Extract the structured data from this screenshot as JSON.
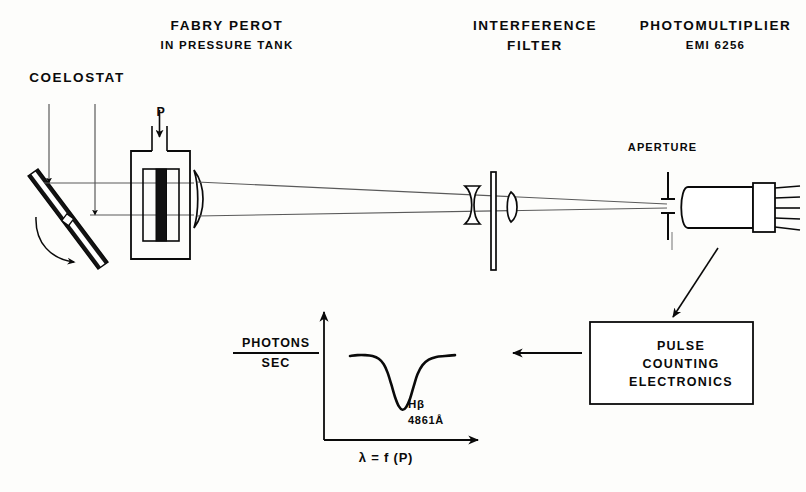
{
  "figure": {
    "type": "optical-schematic"
  },
  "labels": {
    "fabry_perot": "FABRY PEROT",
    "fabry_perot_sub": "IN PRESSURE TANK",
    "coelostat": "COELOSTAT",
    "interference": "INTERFERENCE",
    "interference_sub": "FILTER",
    "photomultiplier": "PHOTOMULTIPLIER",
    "photomultiplier_sub": "EMI 6256",
    "aperture": "APERTURE",
    "pressure_inlet": "P"
  },
  "electronics_box": {
    "line1": "PULSE",
    "line2": "COUNTING",
    "line3": "ELECTRONICS"
  },
  "chart_data": {
    "type": "line",
    "title": "",
    "xlabel": "λ = f (P)",
    "ylabel_numerator": "PHOTONS",
    "ylabel_denominator": "SEC",
    "annotation_line1": "Hβ",
    "annotation_line2": "4861Å",
    "grid": false,
    "legend": false,
    "xlim": [
      0,
      100
    ],
    "ylim": [
      0,
      100
    ],
    "series": [
      {
        "name": "H-beta absorption profile",
        "x": [
          8,
          14,
          20,
          26,
          31,
          35,
          38,
          41,
          44,
          47,
          50,
          53,
          56,
          59,
          62,
          66,
          71,
          77,
          84,
          92
        ],
        "y": [
          78,
          79,
          79,
          78,
          75,
          69,
          60,
          47,
          33,
          23,
          19,
          22,
          31,
          45,
          58,
          68,
          74,
          77,
          78,
          79
        ]
      }
    ]
  },
  "colors": {
    "ink": "#0a0a0a",
    "ray": "#4a4a4a",
    "background": "#fdfdfb",
    "etalon_fill": "#111111"
  },
  "icons": {
    "incoming_ray_1": "down-arrow-icon",
    "incoming_ray_2": "down-arrow-icon",
    "rotation": "curved-arrow-icon",
    "signal_flow": "diagonal-arrow-icon",
    "chart_flow": "left-arrow-icon",
    "y_axis": "up-arrow-icon",
    "x_axis": "right-arrow-icon"
  }
}
